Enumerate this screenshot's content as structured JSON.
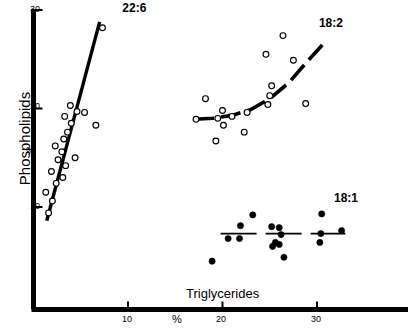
{
  "chart_data": {
    "type": "scatter",
    "title": "",
    "xlabel": "Triglycerides",
    "xunit": "%",
    "ylabel": "Phospholipids",
    "yunit": "%",
    "xlim": [
      0,
      34
    ],
    "ylim": [
      0,
      30
    ],
    "xticks": [
      10,
      20,
      30
    ],
    "yticks": [
      10,
      20,
      30
    ],
    "grid": false,
    "legend_position": "inline-annotations",
    "series": [
      {
        "name": "22:6",
        "marker": "open-circle",
        "label": "22:6",
        "label_x": 9.4,
        "label_y": 30.2,
        "fit_line": {
          "style": "solid",
          "x": [
            1.4,
            7.0
          ],
          "y": [
            8.6,
            28.8
          ]
        },
        "points": [
          {
            "x": 1.6,
            "y": 9.4
          },
          {
            "x": 2.0,
            "y": 10.6
          },
          {
            "x": 1.3,
            "y": 11.5
          },
          {
            "x": 2.4,
            "y": 12.4
          },
          {
            "x": 3.1,
            "y": 13.0
          },
          {
            "x": 1.9,
            "y": 13.6
          },
          {
            "x": 3.4,
            "y": 14.2
          },
          {
            "x": 2.6,
            "y": 14.8
          },
          {
            "x": 4.4,
            "y": 15.0
          },
          {
            "x": 3.0,
            "y": 15.6
          },
          {
            "x": 2.3,
            "y": 16.2
          },
          {
            "x": 3.2,
            "y": 16.9
          },
          {
            "x": 3.6,
            "y": 17.6
          },
          {
            "x": 4.0,
            "y": 18.5
          },
          {
            "x": 3.3,
            "y": 19.2
          },
          {
            "x": 4.6,
            "y": 19.7
          },
          {
            "x": 5.4,
            "y": 19.6
          },
          {
            "x": 3.9,
            "y": 20.3
          },
          {
            "x": 6.6,
            "y": 18.3
          },
          {
            "x": 7.3,
            "y": 28.2
          }
        ]
      },
      {
        "name": "18:2",
        "marker": "open-circle",
        "label": "18:2",
        "label_x": 30.2,
        "label_y": 28.7,
        "fit_line": {
          "style": "dashed-curve",
          "x": [
            17.0,
            19.0,
            21.0,
            23.0,
            25.0,
            27.0,
            29.0,
            30.8
          ],
          "y": [
            18.9,
            19.0,
            19.3,
            19.9,
            21.0,
            22.6,
            24.8,
            26.7
          ]
        },
        "points": [
          {
            "x": 17.2,
            "y": 18.9
          },
          {
            "x": 19.5,
            "y": 19.0
          },
          {
            "x": 20.0,
            "y": 19.8
          },
          {
            "x": 20.1,
            "y": 18.3
          },
          {
            "x": 21.0,
            "y": 19.2
          },
          {
            "x": 19.3,
            "y": 16.7
          },
          {
            "x": 22.6,
            "y": 19.6
          },
          {
            "x": 24.8,
            "y": 20.4
          },
          {
            "x": 25.0,
            "y": 21.3
          },
          {
            "x": 25.2,
            "y": 22.3
          },
          {
            "x": 24.6,
            "y": 25.5
          },
          {
            "x": 27.5,
            "y": 24.9
          },
          {
            "x": 28.8,
            "y": 20.5
          },
          {
            "x": 22.3,
            "y": 17.6
          },
          {
            "x": 26.4,
            "y": 27.4
          },
          {
            "x": 18.2,
            "y": 21.0
          }
        ]
      },
      {
        "name": "18:1",
        "marker": "filled-circle",
        "label": "18:1",
        "label_x": 31.8,
        "label_y": 10.9,
        "fit_line": {
          "style": "dashed-horizontal",
          "x": [
            19.8,
            33.0
          ],
          "y": [
            7.3,
            7.3
          ]
        },
        "points": [
          {
            "x": 20.6,
            "y": 6.8
          },
          {
            "x": 21.8,
            "y": 6.8
          },
          {
            "x": 21.9,
            "y": 8.1
          },
          {
            "x": 23.2,
            "y": 9.2
          },
          {
            "x": 18.9,
            "y": 4.5
          },
          {
            "x": 25.2,
            "y": 8.0
          },
          {
            "x": 26.0,
            "y": 7.9
          },
          {
            "x": 26.2,
            "y": 7.2
          },
          {
            "x": 25.6,
            "y": 6.4
          },
          {
            "x": 26.0,
            "y": 6.2
          },
          {
            "x": 25.3,
            "y": 6.0
          },
          {
            "x": 26.5,
            "y": 4.9
          },
          {
            "x": 30.5,
            "y": 9.3
          },
          {
            "x": 30.4,
            "y": 7.3
          },
          {
            "x": 30.3,
            "y": 6.4
          },
          {
            "x": 32.6,
            "y": 7.6
          }
        ]
      }
    ]
  },
  "axes": {
    "x_tick_labels": [
      "10",
      "20",
      "30"
    ],
    "y_tick_labels": [
      "10",
      "20",
      "30"
    ],
    "x_axis_title": "Triglycerides",
    "y_axis_title": "Phospholipids",
    "x_percent_symbol": "%",
    "y_percent_symbol": "%"
  },
  "style": {
    "axis_color": "#000000",
    "marker_color": "#000000",
    "background": "#ffffff"
  }
}
